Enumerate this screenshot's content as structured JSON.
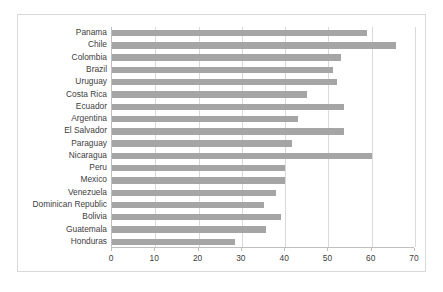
{
  "chart_data": {
    "type": "bar",
    "orientation": "horizontal",
    "title": "",
    "subtitle": "",
    "xlabel": "",
    "ylabel": "",
    "xlim": [
      0,
      70
    ],
    "xticks": [
      0,
      10,
      20,
      30,
      40,
      50,
      60,
      70
    ],
    "grid": "vertical",
    "legend": "none",
    "bar_color": "#a5a5a5",
    "categories": [
      "Panama",
      "Chile",
      "Colombia",
      "Brazil",
      "Uruguay",
      "Costa Rica",
      "Ecuador",
      "Argentina",
      "El Salvador",
      "Paraguay",
      "Nicaragua",
      "Peru",
      "Mexico",
      "Venezuela",
      "Dominican Republic",
      "Bolivia",
      "Guatemala",
      "Honduras"
    ],
    "values": [
      59.0,
      65.5,
      53.0,
      51.0,
      52.0,
      45.0,
      53.5,
      43.0,
      53.5,
      41.5,
      60.0,
      40.0,
      40.0,
      38.0,
      35.0,
      39.0,
      35.5,
      28.5
    ]
  }
}
